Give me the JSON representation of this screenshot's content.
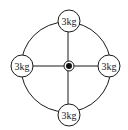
{
  "diagram": {
    "masses": [
      {
        "position": "top",
        "label": "3kg"
      },
      {
        "position": "left",
        "label": "3kg"
      },
      {
        "position": "right",
        "label": "3kg"
      },
      {
        "position": "bottom",
        "label": "3kg"
      }
    ],
    "pivot": {
      "label": ""
    },
    "colors": {
      "stroke": "#1a1a1a",
      "background": "#ffffff"
    }
  }
}
